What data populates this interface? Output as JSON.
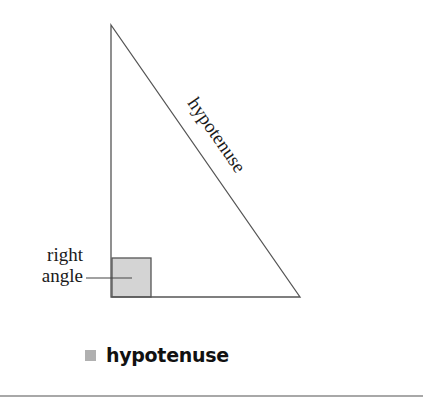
{
  "diagram": {
    "type": "right-triangle",
    "hypotenuse_label": "hypotenuse",
    "right_angle_label_line1": "right",
    "right_angle_label_line2": "angle",
    "right_angle_fill": "#d4d4d4",
    "stroke_color": "#555555"
  },
  "term": {
    "label": "hypotenuse",
    "bullet_color": "#b0b0b0"
  }
}
